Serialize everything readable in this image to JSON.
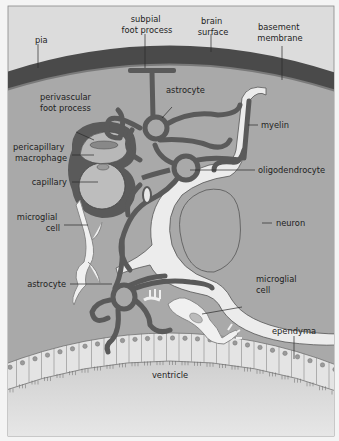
{
  "figure": {
    "colors": {
      "background": "#f4f4f4",
      "tissue": "#a9a9a9",
      "pia": "#4a4a4a",
      "pia_edge": "#777777",
      "astrocyte": "#5a5a5a",
      "neuron": "#ececec",
      "microglia": "#f0f0f0",
      "ependyma_cell": "#e6e6e6",
      "ventricle": "#dadada",
      "label_text": "#1e1e1e",
      "leader_line": "#2a2a2a"
    }
  },
  "labels": {
    "pia": "pia",
    "subpial_foot_process": [
      "subpial",
      "foot process"
    ],
    "brain_surface": [
      "brain",
      "surface"
    ],
    "basement_membrane": [
      "basement",
      "membrane"
    ],
    "astrocyte_top": "astrocyte",
    "perivascular_foot_process": [
      "perivascular",
      "foot process"
    ],
    "pericapillary_macrophage": [
      "pericapillary",
      "macrophage"
    ],
    "capillary": "capillary",
    "myelin": "myelin",
    "oligodendrocyte": "oligodendrocyte",
    "microglial_cell_left": [
      "microglial",
      "cell"
    ],
    "neuron": "neuron",
    "astrocyte_bottom": "astrocyte",
    "microglial_cell_right": [
      "microglial",
      "cell"
    ],
    "ependyma": "ependyma",
    "ventricle": "ventricle"
  }
}
